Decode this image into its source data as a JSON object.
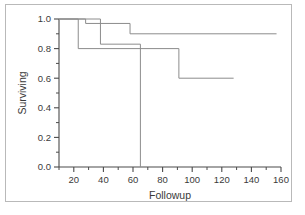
{
  "chart_data": {
    "type": "line",
    "title": "",
    "xlabel": "Followup",
    "ylabel": "Surviving",
    "xlim": [
      10,
      160
    ],
    "ylim": [
      0.0,
      1.0
    ],
    "grid": false,
    "legend": null,
    "xticks": [
      20,
      40,
      60,
      80,
      100,
      120,
      140,
      160
    ],
    "xtick_labels": [
      "20",
      "40",
      "60",
      "80",
      "100",
      "120",
      "140",
      "160"
    ],
    "x_minor_tick_interval": 10,
    "yticks": [
      0.0,
      0.2,
      0.4,
      0.6,
      0.8,
      1.0
    ],
    "ytick_labels": [
      "0.0",
      "0.2",
      "0.4",
      "0.6",
      "0.8",
      "1.0"
    ],
    "y_minor_tick_interval": 0.1,
    "line_color": "#8c8c8c",
    "axis_color": "#4a4a4a",
    "step_style": "post",
    "series": [
      {
        "name": "curve-1",
        "x": [
          10,
          23,
          23,
          91,
          91,
          128
        ],
        "y": [
          1.0,
          1.0,
          0.8,
          0.8,
          0.6,
          0.6
        ]
      },
      {
        "name": "curve-2",
        "x": [
          10,
          28,
          28,
          58,
          58,
          157
        ],
        "y": [
          1.0,
          1.0,
          0.97,
          0.97,
          0.9,
          0.9
        ]
      },
      {
        "name": "curve-3",
        "x": [
          10,
          38,
          38,
          65,
          65
        ],
        "y": [
          1.0,
          1.0,
          0.83,
          0.83,
          0.0
        ]
      }
    ]
  }
}
